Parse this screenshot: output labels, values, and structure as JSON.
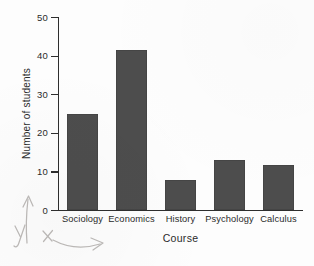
{
  "chart_data": {
    "type": "bar",
    "title": "",
    "xlabel": "Course",
    "ylabel": "Number of students",
    "categories": [
      "Sociology",
      "Economics",
      "History",
      "Psychology",
      "Calculus"
    ],
    "values": [
      25,
      41.5,
      7.7,
      13,
      11.7
    ],
    "ylim": [
      0,
      50
    ],
    "y_ticks": [
      "0",
      "10",
      "20",
      "30",
      "40",
      "50"
    ],
    "y_tick_values": [
      0,
      10,
      20,
      30,
      40,
      50
    ],
    "grid": false,
    "legend": null,
    "bar_color": "#4d4d4d",
    "axis_color": "#2e2e2e",
    "background_color": "#fdfdfd"
  },
  "annotations": {
    "pencil_y_label": "y",
    "pencil_x_label": "x",
    "pencil_y_arrow": "vertical-arrow-up",
    "pencil_x_arrow": "horizontal-arrow-right",
    "pencil_color": "#b9b6b4"
  }
}
